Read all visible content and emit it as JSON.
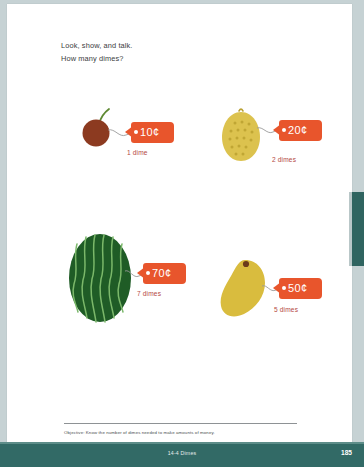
{
  "page": {
    "background_color": "#c6d2d4",
    "sheet_color": "#ffffff",
    "accent_teal": "#326a66",
    "tag_orange": "#e8552c",
    "label_red": "#b5493f"
  },
  "instructions": {
    "line1": "Look, show, and talk.",
    "line2": "How many dimes?"
  },
  "items": [
    {
      "art": "cherry",
      "art_color": "#8c3a20",
      "stem_color": "#5f8a33",
      "price": "10¢",
      "label": "1 dime"
    },
    {
      "art": "lemon",
      "art_color": "#dcc24e",
      "stem_color": "#b9a033",
      "price": "20¢",
      "label": "2 dimes"
    },
    {
      "art": "watermelon",
      "art_color": "#1f5c26",
      "stem_color": "#7bb86a",
      "price": "70¢",
      "label": "7 dimes"
    },
    {
      "art": "mango",
      "art_color": "#d9bc3e",
      "stem_color": "#6b3b1b",
      "price": "50¢",
      "label": "5 dimes"
    }
  ],
  "objective": {
    "text": "Objective: Know the number of dimes needed to make amounts of money."
  },
  "footer": {
    "chapter": "14-4 Dimes",
    "page_number": "185"
  }
}
